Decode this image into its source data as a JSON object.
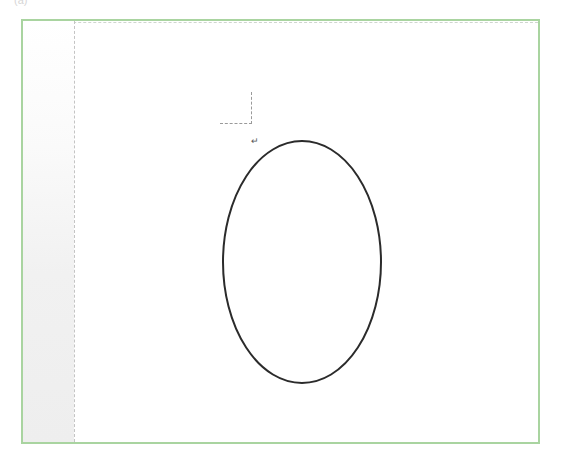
{
  "figure": {
    "label": "(a)"
  },
  "document": {
    "paragraph_mark": "↵",
    "frame_color": "#a9d4a0",
    "shape": {
      "type": "ellipse",
      "cx": 302,
      "cy": 262,
      "rx": 79,
      "ry": 121,
      "stroke": "#2b2b2b",
      "stroke_width": 2,
      "fill": "none"
    }
  }
}
